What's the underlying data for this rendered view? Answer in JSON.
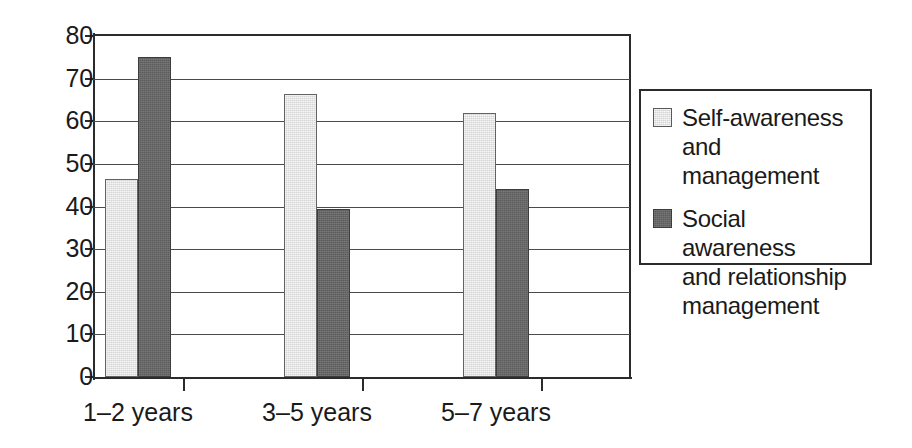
{
  "chart_data": {
    "type": "bar",
    "title": "",
    "subtitle": "",
    "xlabel": "",
    "ylabel": "",
    "categories": [
      "1–2 years",
      "3–5 years",
      "5–7 years"
    ],
    "series": [
      {
        "name": "Self-awareness and management",
        "color": "#d5d5d5",
        "values": [
          46.5,
          66.5,
          62.0
        ]
      },
      {
        "name": "Social awareness and relationship management",
        "color": "#5c5c5c",
        "values": [
          75.0,
          39.5,
          44.0
        ]
      }
    ],
    "ylim": [
      0,
      80
    ],
    "ytick_values": [
      0,
      10,
      20,
      30,
      40,
      50,
      60,
      70,
      80
    ],
    "ytick_labels": [
      "0",
      "10",
      "20",
      "30",
      "40",
      "50",
      "60",
      "70",
      "80"
    ],
    "grid": "horizontal",
    "legend_position": "right",
    "legend": [
      {
        "swatch": "light",
        "lines": [
          "Self-awareness",
          "and management"
        ]
      },
      {
        "swatch": "dark",
        "lines": [
          "Social awareness",
          "and relationship",
          "management"
        ]
      }
    ]
  },
  "colors": {
    "light_bar": "#d5d5d5",
    "dark_bar": "#5c5c5c",
    "axis": "#2b2b2b",
    "grid": "#4a4a4a",
    "background": "#ffffff",
    "text": "#1a1a1a"
  }
}
